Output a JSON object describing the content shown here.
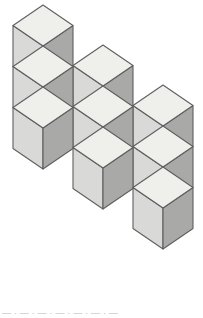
{
  "figure": {
    "background_color": "#ffffff",
    "canvas": {
      "width": 203,
      "height": 318
    }
  },
  "geometry": {
    "half_width": 30,
    "rhombus_half_height": 20.5,
    "cube_side_height": 41,
    "column_step_x": 60,
    "column_step_y": 40,
    "stack_pitch_y": 41,
    "columns": [
      {
        "name": "column-left",
        "apex_x": 43,
        "apex_y": 5,
        "cube_count": 3
      },
      {
        "name": "column-middle",
        "apex_x": 103,
        "apex_y": 45,
        "cube_count": 3
      },
      {
        "name": "column-right",
        "apex_x": 163,
        "apex_y": 85,
        "cube_count": 3
      }
    ]
  },
  "colors": {
    "face_top": "#efefec",
    "face_left": "#d9d9d7",
    "face_right": "#a9a9a7",
    "edge_stroke": "#5f5f5f",
    "edge_stroke_light": "#8c8c8c",
    "background": "#ffffff",
    "caption_text": "#b9b9b9"
  },
  "caption": {
    "clipped_text": "—  ·  —  ·  —  ·  —  ·  —  ·  —  ·  —"
  },
  "chart_data": {
    "type": "diagram",
    "total_cubes": 9,
    "columns": 3,
    "cubes_per_column": 3,
    "cubes": [
      {
        "id": "c1-1",
        "column": 1,
        "level": 1,
        "apex_x": 43,
        "apex_y": 5
      },
      {
        "id": "c1-2",
        "column": 1,
        "level": 2,
        "apex_x": 43,
        "apex_y": 46
      },
      {
        "id": "c1-3",
        "column": 1,
        "level": 3,
        "apex_x": 43,
        "apex_y": 87
      },
      {
        "id": "c2-1",
        "column": 2,
        "level": 1,
        "apex_x": 103,
        "apex_y": 45
      },
      {
        "id": "c2-2",
        "column": 2,
        "level": 2,
        "apex_x": 103,
        "apex_y": 86
      },
      {
        "id": "c2-3",
        "column": 2,
        "level": 3,
        "apex_x": 103,
        "apex_y": 127
      },
      {
        "id": "c3-1",
        "column": 3,
        "level": 1,
        "apex_x": 163,
        "apex_y": 85
      },
      {
        "id": "c3-2",
        "column": 3,
        "level": 2,
        "apex_x": 163,
        "apex_y": 126
      },
      {
        "id": "c3-3",
        "column": 3,
        "level": 3,
        "apex_x": 163,
        "apex_y": 167
      }
    ]
  }
}
